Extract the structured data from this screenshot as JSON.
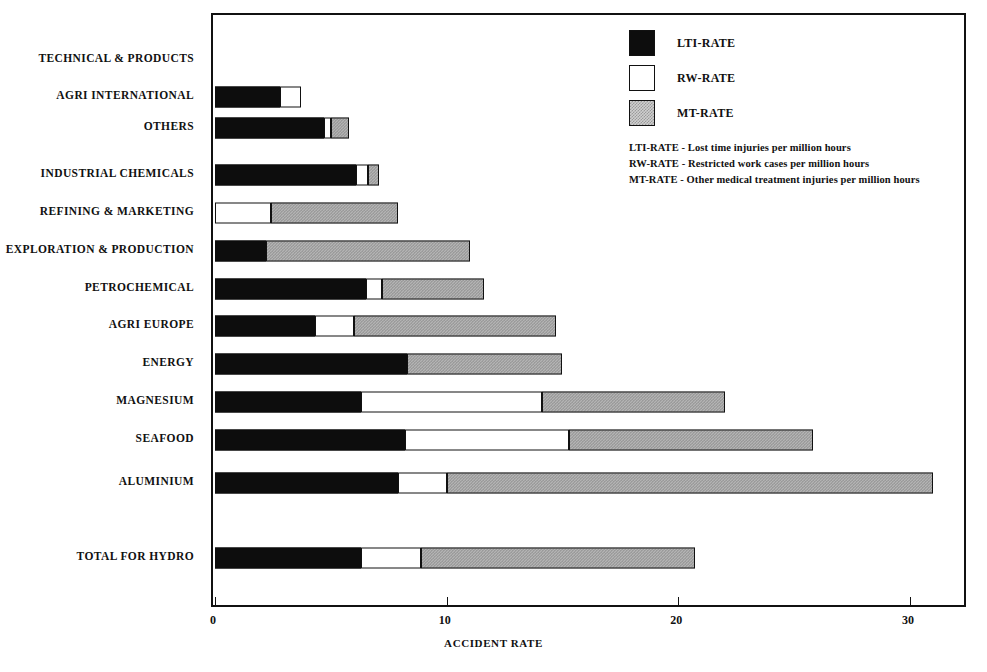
{
  "chart_data": {
    "type": "bar",
    "orientation": "horizontal",
    "stacked": true,
    "title": "",
    "xlabel": "ACCIDENT RATE",
    "ylabel": "",
    "xlim": [
      0,
      32.6
    ],
    "xticks": [
      0,
      10,
      20,
      30
    ],
    "xticklabels": [
      "0",
      "10",
      "20",
      "30"
    ],
    "grid": false,
    "legend_position": "top-right",
    "categories": [
      "TECHNICAL & PRODUCTS",
      "AGRI INTERNATIONAL",
      "OTHERS",
      "INDUSTRIAL CHEMICALS",
      "REFINING & MARKETING",
      "EXPLORATION & PRODUCTION",
      "PETROCHEMICAL",
      "AGRI EUROPE",
      "ENERGY",
      "MAGNESIUM",
      "SEAFOOD",
      "ALUMINIUM",
      "TOTAL FOR HYDRO"
    ],
    "series": [
      {
        "name": "LTI-RATE",
        "color": "#0d0d0d",
        "values": [
          0.0,
          2.8,
          4.7,
          6.1,
          0.0,
          2.2,
          6.5,
          4.3,
          8.3,
          6.3,
          8.2,
          7.9,
          6.3
        ]
      },
      {
        "name": "RW-RATE",
        "color": "#ffffff",
        "values": [
          0.0,
          0.9,
          0.3,
          0.5,
          2.4,
          0.0,
          0.7,
          1.7,
          0.0,
          7.8,
          7.1,
          2.1,
          2.6
        ]
      },
      {
        "name": "MT-RATE",
        "color": "#b4b4b4",
        "values": [
          0.0,
          0.0,
          0.8,
          0.5,
          5.5,
          8.8,
          4.4,
          8.7,
          6.7,
          7.9,
          10.5,
          21.0,
          11.8
        ]
      }
    ],
    "totals": [
      0.0,
      3.7,
      5.8,
      7.1,
      7.9,
      11.0,
      11.6,
      14.7,
      15.0,
      22.0,
      25.8,
      31.0,
      20.7
    ]
  },
  "legend": {
    "entries": [
      {
        "label": "LTI-RATE",
        "swatch": "lti"
      },
      {
        "label": "RW-RATE",
        "swatch": "rw"
      },
      {
        "label": "MT-RATE",
        "swatch": "mt"
      }
    ],
    "notes": [
      "LTI-RATE - Lost time injuries per million hours",
      "RW-RATE - Restricted work cases per million hours",
      "MT-RATE - Other medical treatment injuries per million hours"
    ]
  }
}
